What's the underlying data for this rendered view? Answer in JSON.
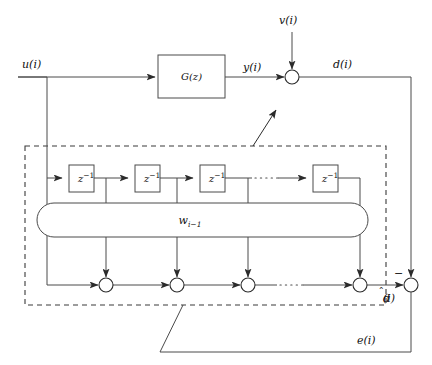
{
  "diagram": {
    "colors": {
      "line": "#4a4a4a",
      "line_dark": "#2b2b2b",
      "dashed": "#3a3a3a",
      "background": "#ffffff",
      "text": "#111111"
    },
    "signals": {
      "input": "u(i)",
      "plant_output": "y(i)",
      "noise": "v(i)",
      "desired": "d(i)",
      "estimate_base": "d",
      "estimate_suffix": "(i)",
      "error": "e(i)",
      "minus_sign": "−"
    },
    "blocks": {
      "plant": "G(z)",
      "delay_base": "z",
      "delay_exponent": "−1",
      "weights_base": "w",
      "weights_subscript": "i−1"
    },
    "delay_boxes": [
      {
        "label_base": "z",
        "label_exp": "−1",
        "x": 69,
        "y": 165,
        "w": 25,
        "h": 27
      },
      {
        "label_base": "z",
        "label_exp": "−1",
        "x": 135,
        "y": 165,
        "w": 25,
        "h": 27
      },
      {
        "label_base": "z",
        "label_exp": "−1",
        "x": 200,
        "y": 165,
        "w": 25,
        "h": 27
      },
      {
        "label_base": "z",
        "label_exp": "−1",
        "x": 313,
        "y": 165,
        "w": 25,
        "h": 27
      }
    ],
    "adders": [
      {
        "name": "plant-noise-adder",
        "cx": 292,
        "cy": 77,
        "r": 7
      },
      {
        "name": "tap-adder-1",
        "cx": 106,
        "cy": 285,
        "r": 7
      },
      {
        "name": "tap-adder-2",
        "cx": 177,
        "cy": 285,
        "r": 7
      },
      {
        "name": "tap-adder-3",
        "cx": 248,
        "cy": 285,
        "r": 7
      },
      {
        "name": "tap-adder-4",
        "cx": 360,
        "cy": 285,
        "r": 7
      },
      {
        "name": "error-adder",
        "cx": 411,
        "cy": 285,
        "r": 7
      }
    ],
    "labels": {
      "u": {
        "text": "u(i)",
        "x": 22,
        "y": 66
      },
      "y": {
        "text": "y(i)",
        "x": 243,
        "y": 71
      },
      "v": {
        "text": "v(i)",
        "x": 279,
        "y": 24
      },
      "d": {
        "text": "d(i)",
        "x": 333,
        "y": 66
      },
      "e": {
        "text": "e(i)",
        "x": 357,
        "y": 344
      },
      "dhat": {
        "x": 383,
        "y": 300
      },
      "weights": {
        "x": 190,
        "y": 224
      }
    },
    "dashed_region": {
      "x": 25,
      "y": 146,
      "w": 361,
      "h": 159
    }
  }
}
